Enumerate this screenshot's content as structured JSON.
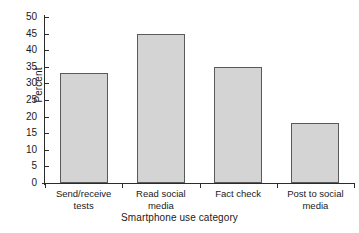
{
  "chart_data": {
    "type": "bar",
    "title": "",
    "subtitle": "",
    "xlabel": "Smartphone use category",
    "ylabel": "Percent",
    "categories": [
      "Send/receive\ntests",
      "Read social\nmedia",
      "Fact check",
      "Post to social\nmedia"
    ],
    "values": [
      33,
      45,
      35,
      18
    ],
    "ylim": [
      0,
      50
    ],
    "yticks": [
      0,
      5,
      10,
      15,
      20,
      25,
      30,
      35,
      40,
      45,
      50
    ],
    "ytick_labels": [
      "0",
      "5",
      "10",
      "15",
      "20",
      "25",
      "30",
      "35",
      "40",
      "45",
      "50"
    ],
    "grid": false,
    "legend": null,
    "legend_position": "none",
    "series": [
      {
        "name": "Percent",
        "values": [
          33,
          45,
          35,
          18
        ]
      }
    ],
    "colors": {
      "bar_fill": "#d4d4d4",
      "bar_edge": "#5a5a5a",
      "axis": "#2b2b2b",
      "text": "#1a1a1a",
      "background": "#ffffff"
    }
  }
}
